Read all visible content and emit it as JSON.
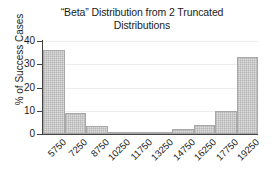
{
  "chart_data": {
    "type": "bar",
    "title": "“Beta” Distribution from 2 Truncated\nDistributions",
    "xlabel": "",
    "ylabel": "% of Success Cases",
    "categories": [
      "5750",
      "7250",
      "8750",
      "10250",
      "11750",
      "13250",
      "14750",
      "16250",
      "17750",
      "19250"
    ],
    "values": [
      36.3,
      9.0,
      3.4,
      0.3,
      0.2,
      0.1,
      2.1,
      4.0,
      9.9,
      33.3
    ],
    "ylim": [
      0,
      40
    ],
    "yticks": [
      0,
      10,
      20,
      30,
      40
    ],
    "ytick_labels": [
      "0",
      "10",
      "20",
      "30",
      "40"
    ],
    "grid": true,
    "grid_axis": "y",
    "legend": null,
    "bar_fill": "#dcdcdc",
    "bar_edge": "#a8a8a8",
    "axis_color": "#444444",
    "grid_color": "#ececec",
    "text_color": "#1c1c1c",
    "background": "#ffffff"
  }
}
